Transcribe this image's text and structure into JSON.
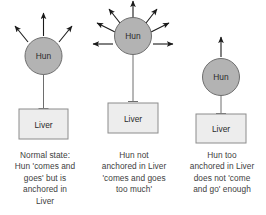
{
  "figure": {
    "title": "",
    "background_color": "#ffffff",
    "node_fill": "#b3b3b3",
    "node_stroke": "#6e6e6e",
    "box_fill": "#ededed",
    "box_stroke": "#8c8c8c",
    "line_color": "#6e6e6e",
    "arrow_color": "#1a1a1a",
    "text_color": "#404040"
  },
  "panels": [
    {
      "id": "normal-state",
      "node_label": "Hun",
      "box_label": "Liver",
      "arrow_count": 3,
      "tether_length": "medium",
      "caption": "Normal state:\nHun 'comes and\ngoes' but is\nanchored in\nLiver"
    },
    {
      "id": "not-anchored",
      "node_label": "Hun",
      "box_label": "Liver",
      "arrow_count": 7,
      "tether_length": "long",
      "caption": "Hun not\nanchored in Liver\n'comes and goes\ntoo much'"
    },
    {
      "id": "too-anchored",
      "node_label": "Hun",
      "box_label": "Liver",
      "arrow_count": 1,
      "tether_length": "short",
      "caption": "Hun too\nanchored in Liver\ndoes not 'come\nand go' enough"
    }
  ]
}
